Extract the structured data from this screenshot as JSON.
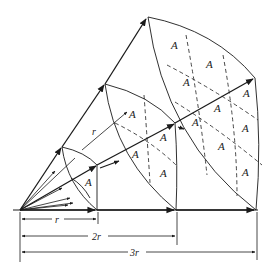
{
  "diagram": {
    "colors": {
      "ink": "#1a1a1a",
      "background": "#ffffff"
    },
    "area_label": "A",
    "ray_label": "r",
    "dimensions": [
      {
        "label": "r"
      },
      {
        "label": "2r"
      },
      {
        "label": "3r"
      }
    ],
    "patches": [
      {
        "distance": "r",
        "count": 1
      },
      {
        "distance": "2r",
        "count": 4
      },
      {
        "distance": "3r",
        "count": 9
      }
    ]
  }
}
